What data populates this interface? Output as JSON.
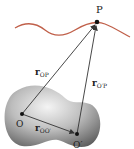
{
  "diagram": {
    "points": {
      "P": {
        "label": "P",
        "x": 97,
        "y": 22
      },
      "O": {
        "label": "O",
        "x": 22,
        "y": 114
      },
      "O_prime": {
        "label": "O′",
        "x": 77,
        "y": 134
      }
    },
    "vectors": {
      "r_OP": {
        "main": "r",
        "sub": "OP"
      },
      "r_OprimeP": {
        "main": "r",
        "sub": "O′P"
      },
      "r_OOprime": {
        "main": "r",
        "sub": "OO′"
      }
    },
    "colors": {
      "curve": "#c0604a",
      "body_light": "#f2f2f2",
      "body_dark": "#6e6e6e",
      "vector": "#333333",
      "point": "#111111"
    }
  }
}
